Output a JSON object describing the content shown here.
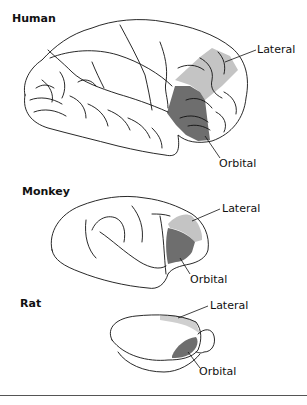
{
  "figure": {
    "panels": [
      {
        "species": "Human",
        "labels": {
          "lateral": "Lateral",
          "orbital": "Orbital"
        }
      },
      {
        "species": "Monkey",
        "labels": {
          "lateral": "Lateral",
          "orbital": "Orbital"
        }
      },
      {
        "species": "Rat",
        "labels": {
          "lateral": "Lateral",
          "orbital": "Orbital"
        }
      }
    ],
    "colors": {
      "lateral_fill": "#c4c4c4",
      "orbital_fill": "#6e6e6e",
      "outline": "#111111",
      "rule": "#555555"
    }
  }
}
